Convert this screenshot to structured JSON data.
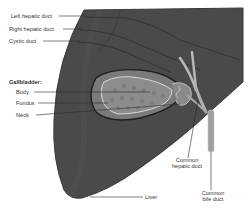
{
  "diagram": {
    "type": "anatomical illustration",
    "colors": {
      "liver": "#4a4a4a",
      "liver_edge": "#3b3b3b",
      "gallbladder_outer": "#7a7a7a",
      "gallbladder_inner": "#8c8c8c",
      "duct": "#b8b8b8",
      "leader_line": "#2a2a2a",
      "background": "#ffffff"
    },
    "labels": {
      "left_hepatic_duct": "Left hepatic duct",
      "right_hepatic_duct": "Right hepatic duct",
      "cystic_duct": "Cystic duct",
      "gallbladder_heading": "Gallbladder:",
      "body": "Body",
      "fundus": "Fundus",
      "neck": "Neck",
      "common_hepatic_duct_line1": "Common",
      "common_hepatic_duct_line2": "hepatic duct",
      "common_bile_duct_line1": "Common",
      "common_bile_duct_line2": "bile duct",
      "liver": "Liver"
    }
  }
}
